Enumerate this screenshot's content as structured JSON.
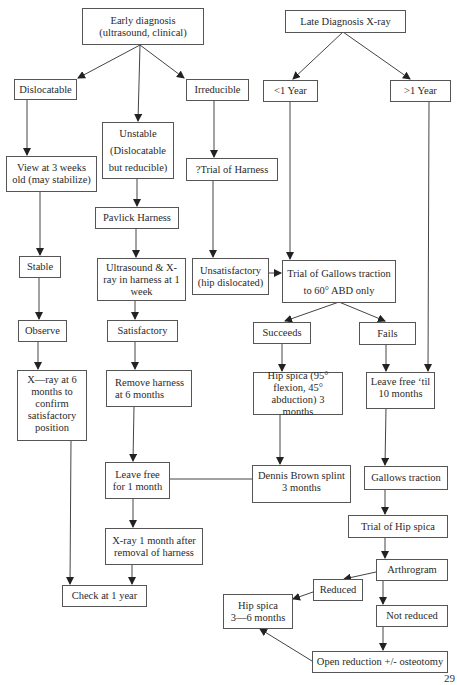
{
  "diagram": {
    "type": "flowchart",
    "nodes": {
      "early": "Early diagnosis\n(ultrasound, clinical)",
      "late": "Late Diagnosis X-ray",
      "dislocatable": "Dislocatable",
      "irreducible": "Irreducible",
      "lt1year": "<1 Year",
      "gt1year": ">1 Year",
      "unstable": "Unstable\n(Dislocatable\nbut reducible)",
      "view3weeks": "View at 3 weeks\nold (may stabilize)",
      "trialHarness": "?Trial of Harness",
      "pavlick": "Pavlick Harness",
      "stable": "Stable",
      "ultrasound": "Ultrasound & X-\nray in harness at 1\nweek",
      "unsatisfactory": "Unsatisfactory\n(hip dislocated)",
      "gallowsTrial": "Trial of Gallows traction\nto 60° ABD only",
      "succeeds": "Succeeds",
      "fails": "Fails",
      "observe": "Observe",
      "satisfactory": "Satisfactory",
      "xray6": "X—ray at 6\nmonths to\nconfirm\nsatisfactory\nposition",
      "removeHarness": "Remove harness\nat 6 months",
      "hipSpica95": "Hip spica (95°\nflexion, 45°\nabduction) 3 months",
      "leaveFreeTil": "Leave free ‘til\n10 months",
      "leaveFree1": "Leave free\nfor 1 month",
      "dennisBrown": "Dennis Brown splint\n3 months",
      "gallows": "Gallows traction",
      "xray1month": "X-ray 1 month after\nremoval of harness",
      "trialHipSpica": "Trial of Hip spica",
      "check1year": "Check at 1 year",
      "arthrogram": "Arthrogram",
      "reduced": "Reduced",
      "hipSpica36": "Hip spica\n3—6 months",
      "notReduced": "Not reduced",
      "openReduction": "Open reduction +/- osteotomy"
    },
    "edges": [
      [
        "early",
        "dislocatable"
      ],
      [
        "early",
        "unstable"
      ],
      [
        "early",
        "irreducible"
      ],
      [
        "late",
        "lt1year"
      ],
      [
        "late",
        "gt1year"
      ],
      [
        "dislocatable",
        "view3weeks"
      ],
      [
        "view3weeks",
        "stable"
      ],
      [
        "stable",
        "observe"
      ],
      [
        "observe",
        "xray6"
      ],
      [
        "xray6",
        "check1year"
      ],
      [
        "unstable",
        "pavlick"
      ],
      [
        "pavlick",
        "ultrasound"
      ],
      [
        "ultrasound",
        "satisfactory"
      ],
      [
        "satisfactory",
        "removeHarness"
      ],
      [
        "removeHarness",
        "leaveFree1"
      ],
      [
        "leaveFree1",
        "xray1month"
      ],
      [
        "xray1month",
        "check1year"
      ],
      [
        "irreducible",
        "trialHarness"
      ],
      [
        "trialHarness",
        "unsatisfactory"
      ],
      [
        "unsatisfactory",
        "gallowsTrial"
      ],
      [
        "lt1year",
        "gallowsTrial"
      ],
      [
        "gallowsTrial",
        "succeeds"
      ],
      [
        "gallowsTrial",
        "fails"
      ],
      [
        "succeeds",
        "hipSpica95"
      ],
      [
        "hipSpica95",
        "dennisBrown"
      ],
      [
        "dennisBrown",
        "leaveFree1"
      ],
      [
        "fails",
        "leaveFreeTil"
      ],
      [
        "gt1year",
        "leaveFreeTil"
      ],
      [
        "leaveFreeTil",
        "gallows"
      ],
      [
        "gallows",
        "trialHipSpica"
      ],
      [
        "trialHipSpica",
        "arthrogram"
      ],
      [
        "arthrogram",
        "reduced"
      ],
      [
        "reduced",
        "hipSpica36"
      ],
      [
        "arthrogram",
        "notReduced"
      ],
      [
        "notReduced",
        "openReduction"
      ],
      [
        "openReduction",
        "hipSpica36"
      ]
    ]
  },
  "page_number": "29"
}
